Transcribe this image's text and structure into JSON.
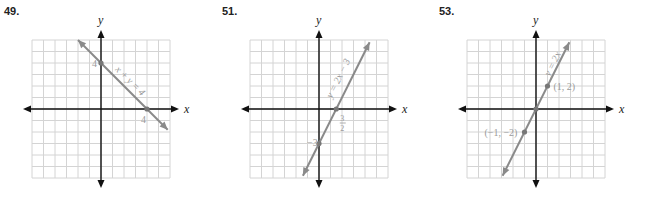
{
  "chart_data": [
    {
      "type": "line",
      "problem_number": "49.",
      "title": "",
      "equation_label": "x + y = 4",
      "xlabel": "x",
      "ylabel": "y",
      "grid": true,
      "xlim": [
        -6,
        6
      ],
      "ylim": [
        -6,
        6
      ],
      "line": {
        "slope": -1,
        "intercept": 4,
        "x_from": -2,
        "x_to": 5.8
      },
      "points": [
        {
          "x": 0,
          "y": 4,
          "label": "4"
        },
        {
          "x": 4,
          "y": 0,
          "label": "4"
        }
      ]
    },
    {
      "type": "line",
      "problem_number": "51.",
      "title": "",
      "equation_label": "y = 2x − 3",
      "xlabel": "x",
      "ylabel": "y",
      "grid": true,
      "xlim": [
        -6,
        6
      ],
      "ylim": [
        -6,
        6
      ],
      "line": {
        "slope": 2,
        "intercept": -3,
        "x_from": -1.4,
        "x_to": 4.4
      },
      "points": [
        {
          "x": 0,
          "y": -3,
          "label": "−3"
        },
        {
          "x": 1.5,
          "y": 0,
          "label": "3/2"
        }
      ]
    },
    {
      "type": "line",
      "problem_number": "53.",
      "title": "",
      "equation_label": "y = 2x",
      "xlabel": "x",
      "ylabel": "y",
      "grid": true,
      "xlim": [
        -6,
        6
      ],
      "ylim": [
        -6,
        6
      ],
      "line": {
        "slope": 2,
        "intercept": 0,
        "x_from": -2.9,
        "x_to": 2.9
      },
      "points": [
        {
          "x": 1,
          "y": 2,
          "label": "(1, 2)"
        },
        {
          "x": 0,
          "y": 0,
          "label": ""
        },
        {
          "x": -1,
          "y": -2,
          "label": "(−1, −2)"
        }
      ]
    }
  ],
  "colors": {
    "grid": "#d4d4d4",
    "axis": "#111111",
    "line": "#8a8a8a",
    "label": "#9a9a9a",
    "number": "#222222"
  }
}
